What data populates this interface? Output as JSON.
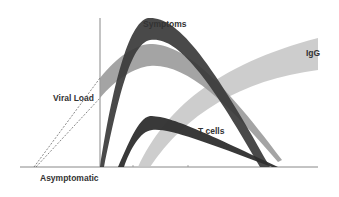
{
  "diagram": {
    "labels": {
      "symptoms": "Symptoms",
      "igg": "IgG",
      "viral_load": "Viral Load",
      "t_cells": "T cells",
      "asymptomatic": "Asymptomatic"
    },
    "colors": {
      "symptoms_band": "#3a3a3a",
      "viral_load_band": "#9a9a9a",
      "igg_band": "#c4c4c4",
      "t_cells_band": "#2e2e2e",
      "axis": "#888888",
      "text": "#333333"
    }
  }
}
